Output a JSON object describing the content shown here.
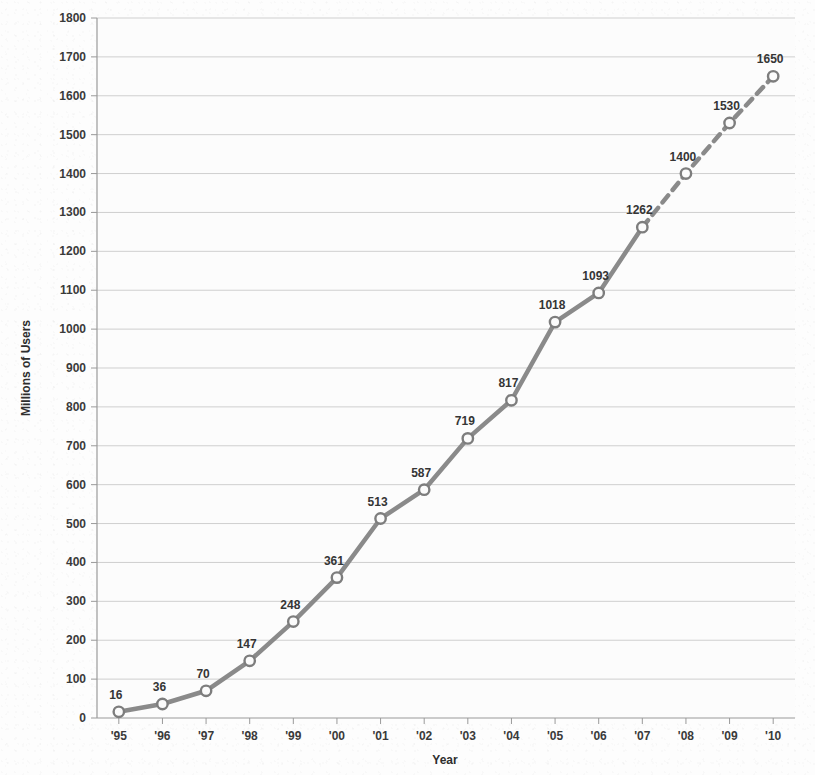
{
  "chart_data": {
    "type": "line",
    "title": "",
    "xlabel": "Year",
    "ylabel": "Millions of Users",
    "categories": [
      "'95",
      "'96",
      "'97",
      "'98",
      "'99",
      "'00",
      "'01",
      "'02",
      "'03",
      "'04",
      "'05",
      "'06",
      "'07",
      "'08",
      "'09",
      "'10"
    ],
    "values": [
      16,
      36,
      70,
      147,
      248,
      361,
      513,
      587,
      719,
      817,
      1018,
      1093,
      1262,
      1400,
      1530,
      1650
    ],
    "point_labels": [
      "16",
      "36",
      "70",
      "147",
      "248",
      "361",
      "513",
      "587",
      "719",
      "817",
      "1018",
      "1093",
      "1262",
      "1400",
      "1530",
      "1650"
    ],
    "ylim": [
      0,
      1800
    ],
    "ytick_step": 100,
    "ytick_labels": [
      "0",
      "100",
      "200",
      "300",
      "400",
      "500",
      "600",
      "700",
      "800",
      "900",
      "1000",
      "1100",
      "1200",
      "1300",
      "1400",
      "1500",
      "1600",
      "1700",
      "1800"
    ],
    "grid": true,
    "grid_axis": "y",
    "legend": "none",
    "series_style": {
      "line_color": "#8a8a8a",
      "marker_fill": "#fbfbfb",
      "marker_edge": "#7d7d7d",
      "solid_until_index": 12,
      "dashed_from_index": 12,
      "dashed_note": "projected"
    }
  },
  "axis": {
    "x_title": "Year",
    "y_title": "Millions of Users"
  },
  "colors": {
    "background": "#fdfdfd",
    "gridline": "#cfcfcf",
    "axis": "#9a9a9a",
    "text": "#353535",
    "line": "#8a8a8a"
  }
}
